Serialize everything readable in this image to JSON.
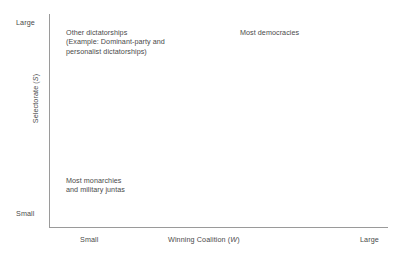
{
  "chart_data": {
    "type": "scatter",
    "title": "",
    "subtitle": "",
    "xlabel_text": "Winning Coalition (",
    "xlabel_var": "W",
    "xlabel_close": ")",
    "ylabel_text": "Selectorate (",
    "ylabel_var": "S",
    "ylabel_close": ")",
    "x_ticks": [
      "Small",
      "Large"
    ],
    "y_ticks": [
      "Large",
      "Small"
    ],
    "xlim": [
      "Small",
      "Large"
    ],
    "ylim": [
      "Small",
      "Large"
    ],
    "grid": false,
    "legend": "none",
    "series": [],
    "annotations": [
      {
        "name": "other-dictatorships",
        "lines": [
          "Other dictatorships",
          "(Example: Dominant-party and",
          "personalist dictatorships)"
        ],
        "x": "Small",
        "y": "Large"
      },
      {
        "name": "most-democracies",
        "lines": [
          "Most democracies"
        ],
        "x": "Large",
        "y": "Large"
      },
      {
        "name": "most-monarchies",
        "lines": [
          "Most monarchies",
          "and military juntas"
        ],
        "x": "Small",
        "y": "Small"
      }
    ]
  },
  "axes": {
    "y": {
      "tick_high": "Large",
      "tick_low": "Small",
      "title_prefix": "Selectorate (",
      "title_var": "S",
      "title_suffix": ")"
    },
    "x": {
      "tick_low": "Small",
      "tick_high": "Large",
      "title_prefix": "Winning Coalition (",
      "title_var": "W",
      "title_suffix": ")"
    }
  },
  "annotations": {
    "dictatorships": {
      "line1": "Other dictatorships",
      "line2": "(Example: Dominant-party and",
      "line3": "personalist dictatorships)"
    },
    "democracies": {
      "line1": "Most democracies"
    },
    "monarchies": {
      "line1": "Most monarchies",
      "line2": "and military juntas"
    }
  },
  "colors": {
    "axis": "#9a9a9a",
    "text": "#4a4a4a",
    "background": "#ffffff"
  }
}
